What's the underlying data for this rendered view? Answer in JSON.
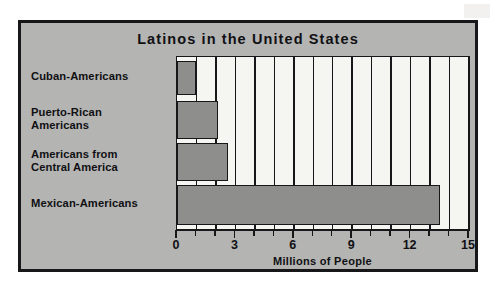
{
  "chart_data": {
    "type": "bar",
    "orientation": "horizontal",
    "title": "Latinos in the United States",
    "xlabel": "Millions of People",
    "ylabel": "",
    "xlim": [
      0,
      15
    ],
    "grid": true,
    "legend": null,
    "major_tick_interval": 3,
    "minor_tick_interval": 1,
    "xticks": [
      "0",
      "3",
      "6",
      "9",
      "12",
      "15"
    ],
    "categories": [
      "Cuban-Americans",
      "Puerto-Rican Americans",
      "Americans from Central America",
      "Mexican-Americans"
    ],
    "values": [
      1.0,
      2.1,
      2.6,
      13.5
    ],
    "colors": {
      "bar_fill": "#8e8e8c",
      "bar_outline": "#17171a",
      "plot_background": "#f5f5f2",
      "frame_background": "#b4b4b2",
      "text": "#101014"
    }
  },
  "frame": {
    "title": "Latinos in the United States",
    "axis_title": "Millions of People"
  },
  "categories": [
    {
      "lines": [
        "Cuban-Americans"
      ],
      "value": 1.0,
      "name": "cuban-americans"
    },
    {
      "lines": [
        "Puerto-Rican",
        "Americans"
      ],
      "value": 2.1,
      "name": "puerto-rican-americans"
    },
    {
      "lines": [
        "Americans from",
        "Central America"
      ],
      "value": 2.6,
      "name": "americans-from-central-america"
    },
    {
      "lines": [
        "Mexican-Americans"
      ],
      "value": 13.5,
      "name": "mexican-americans"
    }
  ],
  "axis": {
    "ticks": [
      {
        "value": 0,
        "label": "0",
        "major": true
      },
      {
        "value": 1,
        "label": "",
        "major": false
      },
      {
        "value": 2,
        "label": "",
        "major": false
      },
      {
        "value": 3,
        "label": "3",
        "major": true
      },
      {
        "value": 4,
        "label": "",
        "major": false
      },
      {
        "value": 5,
        "label": "",
        "major": false
      },
      {
        "value": 6,
        "label": "6",
        "major": true
      },
      {
        "value": 7,
        "label": "",
        "major": false
      },
      {
        "value": 8,
        "label": "",
        "major": false
      },
      {
        "value": 9,
        "label": "9",
        "major": true
      },
      {
        "value": 10,
        "label": "",
        "major": false
      },
      {
        "value": 11,
        "label": "",
        "major": false
      },
      {
        "value": 12,
        "label": "12",
        "major": true
      },
      {
        "value": 13,
        "label": "",
        "major": false
      },
      {
        "value": 14,
        "label": "",
        "major": false
      },
      {
        "value": 15,
        "label": "15",
        "major": true
      }
    ]
  }
}
